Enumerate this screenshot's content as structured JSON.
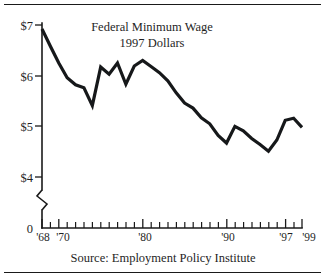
{
  "chart_data": {
    "type": "line",
    "title": "Federal Minimum Wage",
    "subtitle": "1997 Dollars",
    "xlabel": "",
    "ylabel": "",
    "source": "Source: Employment Policy Institute",
    "grid": false,
    "legend": "none",
    "axis_break": true,
    "axis_break_note": "y-axis broken between 0 and $4",
    "ylim": [
      0,
      7
    ],
    "ytick_values": [
      0,
      4,
      5,
      6,
      7
    ],
    "ytick_labels": [
      "0",
      "$4",
      "$5",
      "$6",
      "$7"
    ],
    "xlim": [
      1968,
      1999
    ],
    "xtick_labeled_values": [
      1968,
      1970,
      1980,
      1990,
      1997,
      1999
    ],
    "xtick_labels": [
      "'68",
      "'70",
      "'80",
      "'90",
      "'97",
      "'99"
    ],
    "x": [
      1968,
      1969,
      1970,
      1971,
      1972,
      1973,
      1974,
      1975,
      1976,
      1977,
      1978,
      1979,
      1980,
      1981,
      1982,
      1983,
      1984,
      1985,
      1986,
      1987,
      1988,
      1989,
      1990,
      1991,
      1992,
      1993,
      1994,
      1995,
      1996,
      1997,
      1998,
      1999
    ],
    "values": [
      6.92,
      6.58,
      6.25,
      5.96,
      5.82,
      5.76,
      5.41,
      6.17,
      6.03,
      6.25,
      5.83,
      6.19,
      6.3,
      6.18,
      6.06,
      5.9,
      5.66,
      5.46,
      5.36,
      5.17,
      5.05,
      4.82,
      4.67,
      5.0,
      4.91,
      4.76,
      4.64,
      4.51,
      4.73,
      5.12,
      5.16,
      4.98
    ],
    "series": [
      {
        "name": "Federal Minimum Wage (1997 Dollars)",
        "values": [
          6.92,
          6.58,
          6.25,
          5.96,
          5.82,
          5.76,
          5.41,
          6.17,
          6.03,
          6.25,
          5.83,
          6.19,
          6.3,
          6.18,
          6.06,
          5.9,
          5.66,
          5.46,
          5.36,
          5.17,
          5.05,
          4.82,
          4.67,
          5.0,
          4.91,
          4.76,
          4.64,
          4.51,
          4.73,
          5.12,
          5.16,
          4.98
        ]
      }
    ],
    "line_color": "#16181a",
    "background_color": "#ffffff"
  }
}
